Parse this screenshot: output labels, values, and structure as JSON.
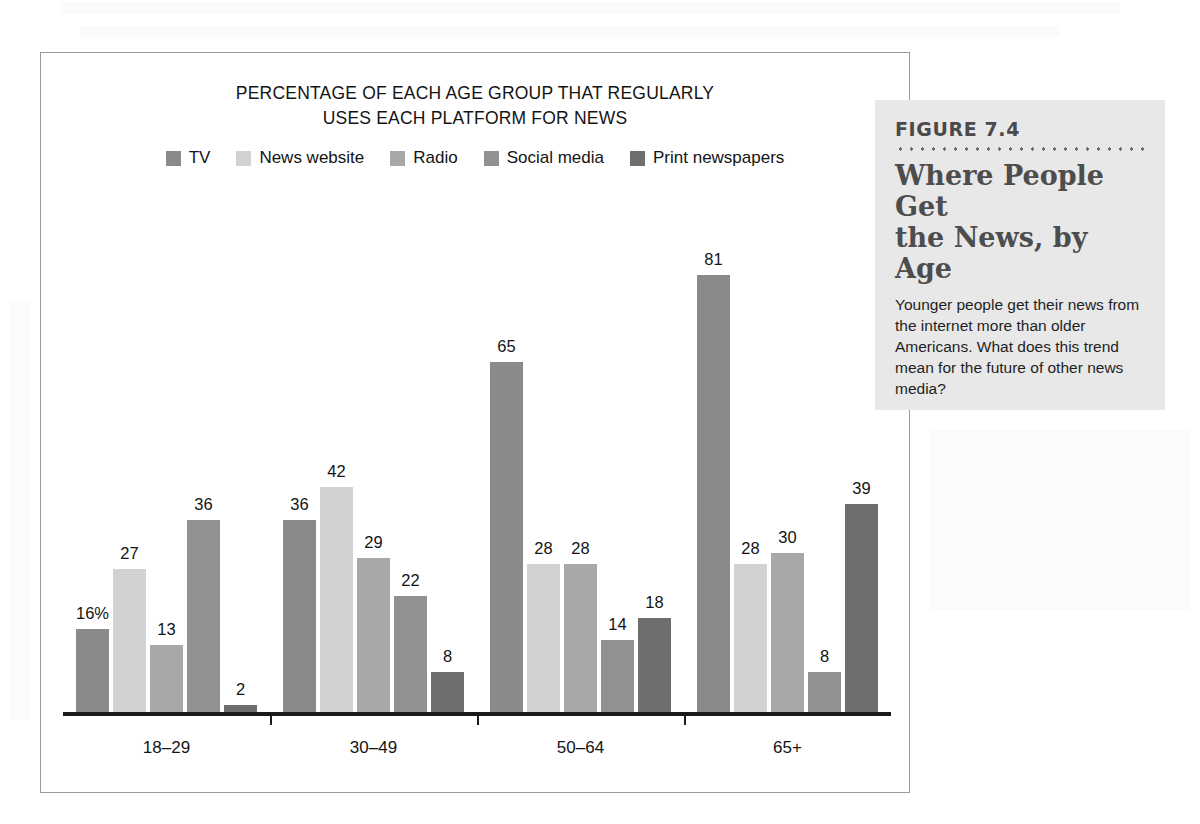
{
  "chart_data": {
    "type": "bar",
    "title": "PERCENTAGE OF EACH AGE GROUP THAT REGULARLY USES EACH PLATFORM FOR NEWS",
    "title_line1": "PERCENTAGE OF EACH AGE GROUP THAT REGULARLY",
    "title_line2": "USES EACH PLATFORM FOR NEWS",
    "xlabel": "",
    "ylabel": "",
    "ylim": [
      0,
      90
    ],
    "grid": false,
    "legend_position": "top-center",
    "categories": [
      "18–29",
      "30–49",
      "50–64",
      "65+"
    ],
    "series": [
      {
        "name": "TV",
        "color": "#8a8a8a",
        "values": [
          16,
          36,
          65,
          81
        ],
        "labels": [
          "16%",
          "36",
          "65",
          "81"
        ]
      },
      {
        "name": "News website",
        "color": "#d2d2d2",
        "values": [
          27,
          42,
          28,
          28
        ],
        "labels": [
          "27",
          "42",
          "28",
          "28"
        ]
      },
      {
        "name": "Radio",
        "color": "#a8a8a8",
        "values": [
          13,
          29,
          28,
          30
        ],
        "labels": [
          "13",
          "29",
          "28",
          "30"
        ]
      },
      {
        "name": "Social media",
        "color": "#919191",
        "values": [
          36,
          22,
          14,
          8
        ],
        "labels": [
          "36",
          "22",
          "14",
          "8"
        ]
      },
      {
        "name": "Print newspapers",
        "color": "#6e6e6e",
        "values": [
          2,
          8,
          18,
          39
        ],
        "labels": [
          "2",
          "8",
          "18",
          "39"
        ]
      }
    ]
  },
  "figure": {
    "number": "FIGURE 7.4",
    "title_line1": "Where People Get",
    "title_line2": "the News, by Age",
    "caption": "Younger people get their news from the internet more than older Americans. What does this trend mean for the future of other news media?"
  }
}
